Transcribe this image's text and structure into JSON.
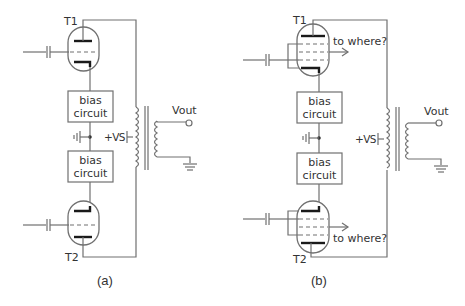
{
  "diagram": {
    "panels": [
      {
        "id": "a",
        "caption": "(a)",
        "tube_top_label": "T1",
        "tube_bottom_label": "T2",
        "tube_type": "triode",
        "bias_top_line1": "bias",
        "bias_top_line2": "circuit",
        "bias_bottom_line1": "bias",
        "bias_bottom_line2": "circuit",
        "supply_label": "+VS",
        "output_label": "Vout"
      },
      {
        "id": "b",
        "caption": "(b)",
        "tube_top_label": "T1",
        "tube_bottom_label": "T2",
        "tube_type": "pentode",
        "bias_top_line1": "bias",
        "bias_top_line2": "circuit",
        "bias_bottom_line1": "bias",
        "bias_bottom_line2": "circuit",
        "supply_label": "+VS",
        "output_label": "Vout",
        "screen_top_label": "to where?",
        "screen_bottom_label": "to where?"
      }
    ],
    "colors": {
      "wire": "#707070",
      "electrode": "#1a1a1a",
      "text": "#333333"
    }
  }
}
